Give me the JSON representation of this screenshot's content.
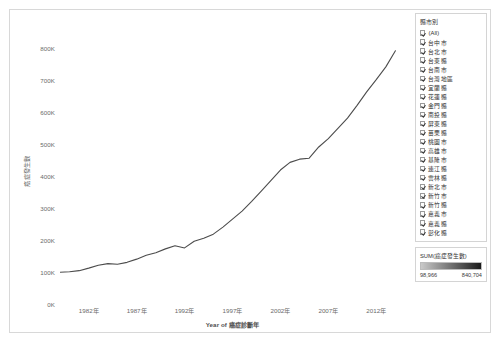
{
  "chart_data": {
    "type": "line",
    "title": "",
    "xlabel": "Year of 癌症診斷年",
    "ylabel": "癌症發生數",
    "xlim": [
      1979,
      2015
    ],
    "ylim": [
      0,
      880000
    ],
    "grid": false,
    "legend_position": "right",
    "y_ticks": [
      "0K",
      "100K",
      "200K",
      "300K",
      "400K",
      "500K",
      "600K",
      "700K",
      "800K"
    ],
    "y_tick_values": [
      0,
      100000,
      200000,
      300000,
      400000,
      500000,
      600000,
      700000,
      800000
    ],
    "x_ticks": [
      "1982年",
      "1987年",
      "1992年",
      "1997年",
      "2002年",
      "2007年",
      "2012年"
    ],
    "x_tick_values": [
      1982,
      1987,
      1992,
      1997,
      2002,
      2007,
      2012
    ],
    "series": [
      {
        "name": "SUM(癌症發生數)",
        "color": "#4c4c4c",
        "x": [
          1979,
          1980,
          1981,
          1982,
          1983,
          1984,
          1985,
          1986,
          1987,
          1988,
          1989,
          1990,
          1991,
          1992,
          1993,
          1994,
          1995,
          1996,
          1997,
          1998,
          1999,
          2000,
          2001,
          2002,
          2003,
          2004,
          2005,
          2006,
          2007,
          2008,
          2009,
          2010,
          2011,
          2012,
          2013,
          2014
        ],
        "values": [
          98966,
          100500,
          104000,
          112000,
          121000,
          126000,
          124000,
          130000,
          140000,
          152000,
          160000,
          172000,
          182000,
          175000,
          196000,
          205000,
          218000,
          240000,
          265000,
          290000,
          320000,
          352000,
          385000,
          418000,
          442000,
          452000,
          455000,
          490000,
          516000,
          548000,
          580000,
          620000,
          662000,
          700000,
          740000,
          790000
        ]
      }
    ],
    "annotations": []
  },
  "legend": {
    "filter": {
      "title": "縣市別",
      "items": [
        {
          "label": "(All)",
          "checked": true
        },
        {
          "label": "台中市",
          "checked": true
        },
        {
          "label": "台北市",
          "checked": true
        },
        {
          "label": "台東縣",
          "checked": true
        },
        {
          "label": "台南市",
          "checked": true
        },
        {
          "label": "台灣地區",
          "checked": true
        },
        {
          "label": "宜蘭縣",
          "checked": true
        },
        {
          "label": "花蓮縣",
          "checked": true
        },
        {
          "label": "金門縣",
          "checked": true
        },
        {
          "label": "南投縣",
          "checked": true
        },
        {
          "label": "屏東縣",
          "checked": true
        },
        {
          "label": "苗栗縣",
          "checked": true
        },
        {
          "label": "桃園市",
          "checked": true
        },
        {
          "label": "高雄市",
          "checked": true
        },
        {
          "label": "基隆市",
          "checked": true
        },
        {
          "label": "連江縣",
          "checked": true
        },
        {
          "label": "雲林縣",
          "checked": true
        },
        {
          "label": "新北市",
          "checked": true
        },
        {
          "label": "新竹市",
          "checked": true
        },
        {
          "label": "新竹縣",
          "checked": true
        },
        {
          "label": "嘉義市",
          "checked": true
        },
        {
          "label": "嘉義縣",
          "checked": true
        },
        {
          "label": "彰化縣",
          "checked": true
        }
      ]
    },
    "gradient": {
      "title": "SUM(癌症發生數)",
      "min_label": "98,966",
      "max_label": "840,704",
      "min_color": "#c9c9c9",
      "max_color": "#1a1a1a"
    }
  }
}
